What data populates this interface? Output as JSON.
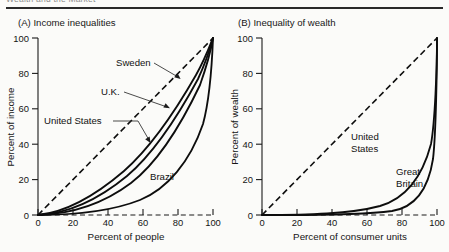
{
  "page": {
    "running_head": "Wealth and the Market",
    "background_color": "#fbfbf9",
    "ink_color": "#0d0d0d"
  },
  "chart_data": [
    {
      "id": "panel-a",
      "type": "line",
      "title": "(A) Income inequalities",
      "xlabel": "Percent of people",
      "ylabel": "Percent of income",
      "xlim": [
        0,
        100
      ],
      "ylim": [
        0,
        100
      ],
      "xticks": [
        0,
        20,
        40,
        60,
        80,
        100
      ],
      "yticks": [
        0,
        20,
        40,
        60,
        80,
        100
      ],
      "xticklabels": [
        "0",
        "20",
        "40",
        "60",
        "80",
        "100"
      ],
      "yticklabels": [
        "0",
        "20",
        "40",
        "60",
        "80",
        "100"
      ],
      "grid": false,
      "legend_position": "inline-annotations",
      "x": [
        0,
        10,
        20,
        30,
        40,
        50,
        60,
        70,
        80,
        90,
        95,
        100
      ],
      "series": [
        {
          "name": "Line of equality",
          "style": "dashed",
          "values": [
            0,
            10,
            20,
            30,
            40,
            50,
            60,
            70,
            80,
            90,
            95,
            100
          ]
        },
        {
          "name": "Sweden",
          "style": "solid",
          "values": [
            0,
            3.5,
            8.0,
            13.5,
            20.0,
            27.5,
            36.5,
            47.0,
            59.5,
            75.0,
            85.0,
            100
          ]
        },
        {
          "name": "U.K.",
          "style": "solid",
          "values": [
            0,
            2.8,
            6.8,
            11.8,
            17.8,
            25.0,
            33.5,
            44.0,
            57.0,
            73.0,
            83.5,
            100
          ]
        },
        {
          "name": "United States",
          "style": "solid",
          "values": [
            0,
            2.0,
            5.2,
            9.5,
            15.0,
            21.5,
            29.5,
            39.5,
            52.5,
            69.5,
            81.0,
            100
          ]
        },
        {
          "name": "Brazil",
          "style": "solid",
          "values": [
            0,
            0.8,
            2.2,
            4.3,
            7.2,
            11.0,
            16.2,
            23.5,
            34.0,
            52.0,
            68.0,
            100
          ]
        }
      ],
      "annotations": [
        {
          "text": "Sweden",
          "points_to": "Sweden curve"
        },
        {
          "text": "U.K.",
          "points_to": "U.K. curve"
        },
        {
          "text": "United States",
          "points_to": "United States curve"
        },
        {
          "text": "Brazil",
          "points_to": "Brazil curve"
        }
      ]
    },
    {
      "id": "panel-b",
      "type": "line",
      "title": "(B) Inequality of wealth",
      "xlabel": "Percent of consumer units",
      "ylabel": "Percent of wealth",
      "xlim": [
        0,
        100
      ],
      "ylim": [
        0,
        100
      ],
      "xticks": [
        0,
        20,
        40,
        60,
        80,
        100
      ],
      "yticks": [
        0,
        20,
        40,
        60,
        80,
        100
      ],
      "xticklabels": [
        "0",
        "20",
        "40",
        "60",
        "80",
        "100"
      ],
      "yticklabels": [
        "0",
        "20",
        "40",
        "60",
        "80",
        "100"
      ],
      "grid": false,
      "legend_position": "inline-annotations",
      "x": [
        0,
        10,
        20,
        30,
        40,
        50,
        60,
        70,
        80,
        90,
        95,
        100
      ],
      "series": [
        {
          "name": "Line of equality",
          "style": "dashed",
          "values": [
            0,
            10,
            20,
            30,
            40,
            50,
            60,
            70,
            80,
            90,
            95,
            100
          ]
        },
        {
          "name": "United States",
          "style": "solid",
          "values": [
            0,
            0.2,
            0.6,
            1.3,
            2.6,
            4.6,
            8.0,
            13.5,
            23.0,
            42.0,
            60.0,
            100
          ]
        },
        {
          "name": "Great Britain",
          "style": "solid",
          "values": [
            0,
            0.1,
            0.3,
            0.7,
            1.3,
            2.3,
            3.9,
            6.6,
            11.5,
            24.0,
            40.0,
            100
          ]
        }
      ],
      "annotations": [
        {
          "text": "United",
          "points_to": "United States curve"
        },
        {
          "text": "States",
          "points_to": "United States curve"
        },
        {
          "text": "Great",
          "points_to": "Great Britain curve"
        },
        {
          "text": "Britain",
          "points_to": "Great Britain curve"
        }
      ]
    }
  ]
}
